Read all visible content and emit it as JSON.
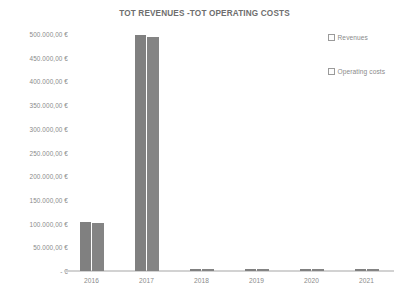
{
  "chart_data": {
    "type": "bar",
    "title": "TOT REVENUES -TOT OPERATING COSTS",
    "xlabel": "",
    "ylabel": "",
    "categories": [
      "2016",
      "2017",
      "2018",
      "2019",
      "2020",
      "2021"
    ],
    "series": [
      {
        "name": "Revenues",
        "values": [
          103000,
          497000,
          2500,
          2500,
          2500,
          2500
        ]
      },
      {
        "name": "Operating costs",
        "values": [
          101000,
          493000,
          2500,
          2500,
          2500,
          2500
        ]
      }
    ],
    "ytick_labels": [
      "500.000,00 €",
      "450.000,00 €",
      "400.000,00 €",
      "350.000,00 €",
      "300.000,00 €",
      "250.000,00 €",
      "200.000,00 €",
      "150.000,00 €",
      "100.000,00 €",
      "50.000,00 €",
      "- €"
    ],
    "ytick_values": [
      500000,
      450000,
      400000,
      350000,
      300000,
      250000,
      200000,
      150000,
      100000,
      50000,
      0
    ],
    "ylim": [
      0,
      500000
    ],
    "grid": false,
    "legend_position": "right",
    "bar_color": "#808080",
    "axis_color": "#d2d2d2",
    "text_color": "#8a8a8a"
  },
  "legend": {
    "entries": [
      {
        "label": "Revenues"
      },
      {
        "label": "Operating costs"
      }
    ]
  }
}
